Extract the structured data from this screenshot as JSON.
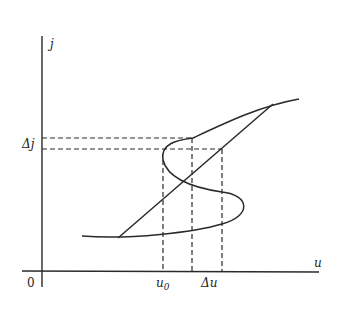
{
  "figure": {
    "type": "S-shaped current-voltage characteristic diagram",
    "axes": {
      "y_label": "j",
      "x_label": "u",
      "origin_label": "0"
    },
    "annotations": {
      "delta_j": "Δj",
      "u0": "u",
      "u0_subscript": "0",
      "delta_u": "Δu"
    },
    "elements": [
      "vertical axis j",
      "horizontal axis u",
      "S-shaped characteristic curve",
      "straight load line",
      "dashed projection lines for Δj",
      "dashed projection lines for u0 and Δu"
    ],
    "colors": {
      "line": "#2a2a2a",
      "background": "#ffffff"
    }
  }
}
